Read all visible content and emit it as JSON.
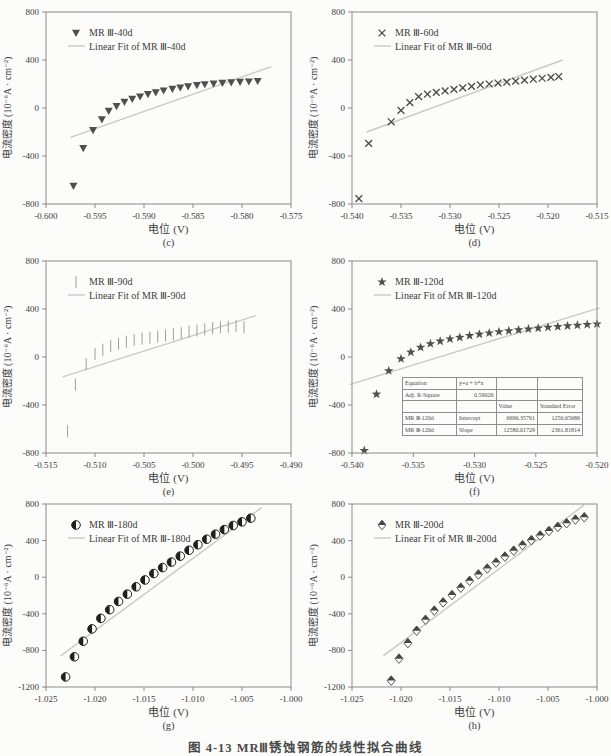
{
  "page": {
    "caption": "图 4-13  MRⅢ锈蚀钢筋的线性拟合曲线",
    "background": "#fcfcfa"
  },
  "axis_labels": {
    "x": "电位 (V)",
    "y": "电流密度 (10⁻⁶A · cm⁻²)"
  },
  "style": {
    "axis_color": "#8a8a8a",
    "text_color": "#3c3c3c",
    "fit_line_color": "#ccc9c2",
    "page_bg": "#fcfcfa"
  },
  "chart_data": [
    {
      "id": "c",
      "type": "scatter",
      "sublabel": "(c)",
      "legend": [
        "MR Ⅲ-40d",
        "Linear Fit of MR Ⅲ-40d"
      ],
      "legend_position": "top-left-inside",
      "marker": "triangle-down-filled",
      "marker_color": "#4f4f4f",
      "grid": false,
      "x_range": [
        -0.6,
        -0.575
      ],
      "x_ticks": [
        "-0.600",
        "-0.595",
        "-0.590",
        "-0.585",
        "-0.580",
        "-0.575"
      ],
      "y_range": [
        -800,
        800
      ],
      "y_ticks": [
        "800",
        "400",
        "0",
        "-400",
        "-800"
      ],
      "points": [
        [
          -0.5972,
          -650
        ],
        [
          -0.5962,
          -335
        ],
        [
          -0.5952,
          -185
        ],
        [
          -0.5943,
          -95
        ],
        [
          -0.5936,
          -25
        ],
        [
          -0.5928,
          15
        ],
        [
          -0.592,
          50
        ],
        [
          -0.5912,
          75
        ],
        [
          -0.5904,
          95
        ],
        [
          -0.5896,
          115
        ],
        [
          -0.5888,
          130
        ],
        [
          -0.588,
          145
        ],
        [
          -0.5871,
          158
        ],
        [
          -0.5863,
          170
        ],
        [
          -0.5855,
          180
        ],
        [
          -0.5846,
          190
        ],
        [
          -0.5838,
          197
        ],
        [
          -0.5829,
          203
        ],
        [
          -0.582,
          208
        ],
        [
          -0.5811,
          213
        ],
        [
          -0.5802,
          217
        ],
        [
          -0.5793,
          220
        ],
        [
          -0.5784,
          224
        ]
      ],
      "fit_line": [
        [
          -0.5975,
          -245
        ],
        [
          -0.577,
          345
        ]
      ]
    },
    {
      "id": "d",
      "type": "scatter",
      "sublabel": "(d)",
      "legend": [
        "MR Ⅲ-60d",
        "Linear Fit of MR Ⅲ-60d"
      ],
      "legend_position": "top-left-inside",
      "marker": "x-cross",
      "marker_color": "#4a4a4a",
      "grid": false,
      "x_range": [
        -0.54,
        -0.515
      ],
      "x_ticks": [
        "-0.540",
        "-0.535",
        "-0.530",
        "-0.525",
        "-0.520",
        "-0.515"
      ],
      "y_range": [
        -800,
        800
      ],
      "y_ticks": [
        "800",
        "400",
        "0",
        "-400",
        "-800"
      ],
      "points": [
        [
          -0.5393,
          -755
        ],
        [
          -0.5383,
          -295
        ],
        [
          -0.536,
          -115
        ],
        [
          -0.535,
          -20
        ],
        [
          -0.5341,
          45
        ],
        [
          -0.5332,
          95
        ],
        [
          -0.5323,
          115
        ],
        [
          -0.5314,
          130
        ],
        [
          -0.5305,
          143
        ],
        [
          -0.5296,
          155
        ],
        [
          -0.5287,
          168
        ],
        [
          -0.5278,
          180
        ],
        [
          -0.5269,
          192
        ],
        [
          -0.526,
          200
        ],
        [
          -0.5251,
          208
        ],
        [
          -0.5242,
          216
        ],
        [
          -0.5233,
          224
        ],
        [
          -0.5224,
          232
        ],
        [
          -0.5215,
          240
        ],
        [
          -0.5206,
          248
        ],
        [
          -0.5197,
          255
        ],
        [
          -0.5189,
          262
        ]
      ],
      "fit_line": [
        [
          -0.5385,
          -200
        ],
        [
          -0.5185,
          400
        ]
      ]
    },
    {
      "id": "e",
      "type": "scatter",
      "sublabel": "(e)",
      "legend": [
        "MR Ⅲ-90d",
        "Linear Fit of MR Ⅲ-90d"
      ],
      "legend_position": "top-left-inside",
      "marker": "vertical-dash",
      "marker_color": "#9aa0a0",
      "grid": false,
      "x_range": [
        -0.515,
        -0.49
      ],
      "x_ticks": [
        "-0.515",
        "-0.510",
        "-0.505",
        "-0.500",
        "-0.495",
        "-0.490"
      ],
      "y_range": [
        -800,
        800
      ],
      "y_ticks": [
        "800",
        "400",
        "0",
        "-400",
        "-800"
      ],
      "points": [
        [
          -0.5128,
          -620
        ],
        [
          -0.512,
          -230
        ],
        [
          -0.5109,
          -60
        ],
        [
          -0.51,
          25
        ],
        [
          -0.5092,
          60
        ],
        [
          -0.5084,
          90
        ],
        [
          -0.5076,
          110
        ],
        [
          -0.5068,
          128
        ],
        [
          -0.506,
          142
        ],
        [
          -0.5052,
          152
        ],
        [
          -0.5044,
          162
        ],
        [
          -0.5036,
          170
        ],
        [
          -0.5028,
          178
        ],
        [
          -0.502,
          188
        ],
        [
          -0.5012,
          198
        ],
        [
          -0.5004,
          210
        ],
        [
          -0.4996,
          220
        ],
        [
          -0.4988,
          230
        ],
        [
          -0.498,
          240
        ],
        [
          -0.4972,
          248
        ],
        [
          -0.4964,
          252
        ],
        [
          -0.4956,
          256
        ],
        [
          -0.4948,
          248
        ]
      ],
      "fit_line": [
        [
          -0.5133,
          -165
        ],
        [
          -0.4936,
          345
        ]
      ]
    },
    {
      "id": "f",
      "type": "scatter",
      "sublabel": "(f)",
      "legend": [
        "MR Ⅲ-120d",
        "Linear Fit of MR Ⅲ-120d"
      ],
      "legend_position": "top-left-inside",
      "marker": "star-filled",
      "marker_color": "#4f4f4f",
      "grid": false,
      "x_range": [
        -0.54,
        -0.52
      ],
      "x_ticks": [
        "-0.540",
        "-0.535",
        "-0.530",
        "-0.525",
        "-0.520"
      ],
      "y_range": [
        -800,
        800
      ],
      "y_ticks": [
        "800",
        "400",
        "0",
        "-400",
        "-800"
      ],
      "points": [
        [
          -0.539,
          -780
        ],
        [
          -0.538,
          -310
        ],
        [
          -0.537,
          -115
        ],
        [
          -0.536,
          -15
        ],
        [
          -0.5352,
          40
        ],
        [
          -0.5344,
          80
        ],
        [
          -0.5336,
          110
        ],
        [
          -0.5328,
          132
        ],
        [
          -0.532,
          150
        ],
        [
          -0.5312,
          163
        ],
        [
          -0.5304,
          178
        ],
        [
          -0.5296,
          190
        ],
        [
          -0.5288,
          200
        ],
        [
          -0.528,
          210
        ],
        [
          -0.5272,
          218
        ],
        [
          -0.5264,
          226
        ],
        [
          -0.5256,
          233
        ],
        [
          -0.5248,
          240
        ],
        [
          -0.524,
          247
        ],
        [
          -0.5232,
          253
        ],
        [
          -0.5224,
          259
        ],
        [
          -0.5216,
          264
        ],
        [
          -0.5208,
          270
        ],
        [
          -0.52,
          275
        ]
      ],
      "fit_line": [
        [
          -0.5402,
          -230
        ],
        [
          -0.5198,
          410
        ]
      ],
      "inset_table": {
        "rows": [
          [
            "Equation",
            "y=a + b*x",
            "",
            ""
          ],
          [
            "Adj. R-Square",
            "0.59026",
            "",
            ""
          ],
          [
            "",
            "",
            "Value",
            "Standard Error"
          ],
          [
            "MR Ⅲ-120d",
            "Intercept",
            "6696.35761",
            "1250.65686"
          ],
          [
            "MR Ⅲ-120d",
            "Slope",
            "12580.01729",
            "2361.81814"
          ]
        ]
      }
    },
    {
      "id": "g",
      "type": "scatter",
      "sublabel": "(g)",
      "legend": [
        "MR Ⅲ-180d",
        "Linear Fit of MR Ⅲ-180d"
      ],
      "legend_position": "top-left-inside",
      "marker": "circle-half-filled",
      "marker_color": "#1f1f1f",
      "grid": false,
      "x_range": [
        -1.025,
        -1.0
      ],
      "x_ticks": [
        "-1.025",
        "-1.020",
        "-1.015",
        "-1.010",
        "-1.005",
        "-1.000"
      ],
      "y_range": [
        -1200,
        800
      ],
      "y_ticks": [
        "800",
        "400",
        "0",
        "-400",
        "-800",
        "-1200"
      ],
      "points": [
        [
          -1.023,
          -1090
        ],
        [
          -1.0221,
          -870
        ],
        [
          -1.0212,
          -700
        ],
        [
          -1.0203,
          -565
        ],
        [
          -1.0194,
          -450
        ],
        [
          -1.0185,
          -355
        ],
        [
          -1.0176,
          -265
        ],
        [
          -1.0167,
          -185
        ],
        [
          -1.0158,
          -105
        ],
        [
          -1.0149,
          -30
        ],
        [
          -1.014,
          40
        ],
        [
          -1.0131,
          105
        ],
        [
          -1.0122,
          165
        ],
        [
          -1.0113,
          230
        ],
        [
          -1.0104,
          295
        ],
        [
          -1.0095,
          355
        ],
        [
          -1.0086,
          415
        ],
        [
          -1.0077,
          470
        ],
        [
          -1.0068,
          520
        ],
        [
          -1.0059,
          565
        ],
        [
          -1.005,
          605
        ],
        [
          -1.0041,
          645
        ]
      ],
      "fit_line": [
        [
          -1.0235,
          -860
        ],
        [
          -1.003,
          760
        ]
      ]
    },
    {
      "id": "h",
      "type": "scatter",
      "sublabel": "(h)",
      "legend": [
        "MR Ⅲ-200d",
        "Linear Fit of MR Ⅲ-200d"
      ],
      "legend_position": "top-left-inside",
      "marker": "diamond-half-filled",
      "marker_color": "#454545",
      "grid": false,
      "x_range": [
        -1.025,
        -1.0
      ],
      "x_ticks": [
        "-1.025",
        "-1.020",
        "-1.015",
        "-1.010",
        "-1.005",
        "-1.000"
      ],
      "y_range": [
        -1200,
        800
      ],
      "y_ticks": [
        "800",
        "400",
        "0",
        "-400",
        "-800",
        "-1200"
      ],
      "points": [
        [
          -1.021,
          -1130
        ],
        [
          -1.0202,
          -890
        ],
        [
          -1.0193,
          -720
        ],
        [
          -1.0184,
          -585
        ],
        [
          -1.0175,
          -465
        ],
        [
          -1.0166,
          -365
        ],
        [
          -1.0157,
          -275
        ],
        [
          -1.0148,
          -195
        ],
        [
          -1.0139,
          -115
        ],
        [
          -1.013,
          -40
        ],
        [
          -1.0121,
          30
        ],
        [
          -1.0112,
          95
        ],
        [
          -1.0103,
          160
        ],
        [
          -1.0094,
          225
        ],
        [
          -1.0085,
          290
        ],
        [
          -1.0076,
          350
        ],
        [
          -1.0067,
          405
        ],
        [
          -1.0058,
          455
        ],
        [
          -1.0049,
          505
        ],
        [
          -1.004,
          550
        ],
        [
          -1.0031,
          590
        ],
        [
          -1.0022,
          630
        ],
        [
          -1.0013,
          655
        ]
      ],
      "fit_line": [
        [
          -1.0218,
          -860
        ],
        [
          -1.0013,
          790
        ]
      ]
    }
  ]
}
